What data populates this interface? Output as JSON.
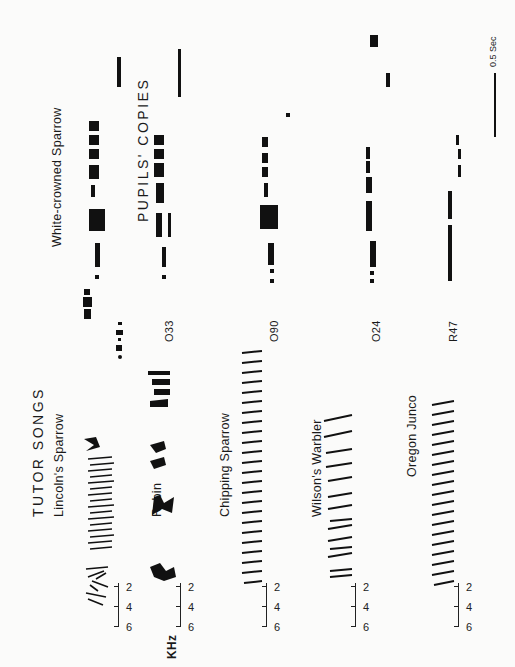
{
  "figure": {
    "orientation": "rotated 90 degrees counter-clockwise",
    "left_panel": {
      "title": "TUTOR SONGS",
      "frequency_unit": "KHz",
      "species": [
        {
          "name": "Lincoln's Sparrow",
          "axis_ticks": [
            "6",
            "4",
            "2"
          ]
        },
        {
          "name": "Robin",
          "axis_ticks": [
            "6",
            "4",
            "2"
          ]
        },
        {
          "name": "Chipping Sparrow",
          "axis_ticks": [
            "6",
            "4",
            "2"
          ]
        },
        {
          "name": "Wilson's Warbler",
          "axis_ticks": [
            "6",
            "4",
            "2"
          ]
        },
        {
          "name": "Oregon Junco",
          "axis_ticks": [
            "6",
            "4",
            "2"
          ]
        }
      ]
    },
    "right_panel": {
      "tutor_label": "White-crowned Sparrow",
      "title": "PUPILS' COPIES",
      "pupils": [
        {
          "id": "O33"
        },
        {
          "id": "O90"
        },
        {
          "id": "O24"
        },
        {
          "id": "R47"
        }
      ]
    },
    "scale_bar": {
      "label": "0.5 Sec"
    }
  }
}
